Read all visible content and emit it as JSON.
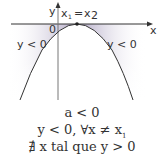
{
  "diagram": {
    "axes": {
      "x_label": "x",
      "y_label": "y",
      "origin_label": "0"
    },
    "vertex_label": {
      "lhs": "x",
      "lhs_sub": "1",
      "eq": "=",
      "rhs": "x",
      "rhs_sub": "2"
    },
    "regions": {
      "left": "y < 0",
      "right": "y < 0"
    },
    "colors": {
      "shade": "#b8b0c8",
      "curve": "#333333",
      "axis": "#333333"
    },
    "conditions": {
      "line1": "a < 0",
      "line2": "y < 0, ∀x ≠ x",
      "line2_sub": "1",
      "line3": "∄ x tal que y > 0"
    }
  }
}
